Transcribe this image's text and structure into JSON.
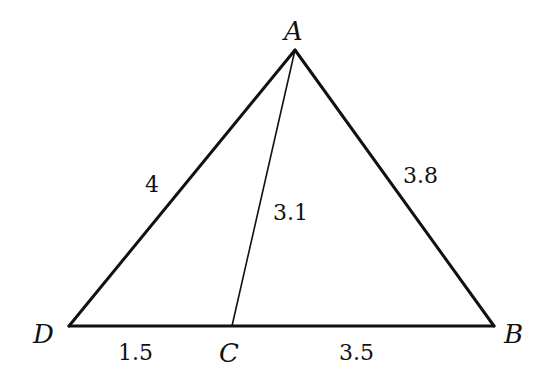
{
  "diagram": {
    "type": "triangle-with-cevian",
    "points": {
      "A": {
        "label": "A",
        "x": 295,
        "y": 50
      },
      "B": {
        "label": "B",
        "x": 494,
        "y": 326
      },
      "C": {
        "label": "C",
        "x": 232,
        "y": 326
      },
      "D": {
        "label": "D",
        "x": 69,
        "y": 326
      }
    },
    "segments": [
      {
        "from": "D",
        "to": "A",
        "length": "4"
      },
      {
        "from": "A",
        "to": "B",
        "length": "3.8"
      },
      {
        "from": "A",
        "to": "C",
        "length": "3.1"
      },
      {
        "from": "D",
        "to": "C",
        "length": "1.5"
      },
      {
        "from": "C",
        "to": "B",
        "length": "3.5"
      }
    ],
    "labels": {
      "vertex_A": "A",
      "vertex_B": "B",
      "vertex_C": "C",
      "vertex_D": "D",
      "len_DA": "4",
      "len_AB": "3.8",
      "len_AC": "3.1",
      "len_DC": "1.5",
      "len_CB": "3.5"
    },
    "colors": {
      "stroke": "#111111",
      "background": "#ffffff"
    }
  }
}
